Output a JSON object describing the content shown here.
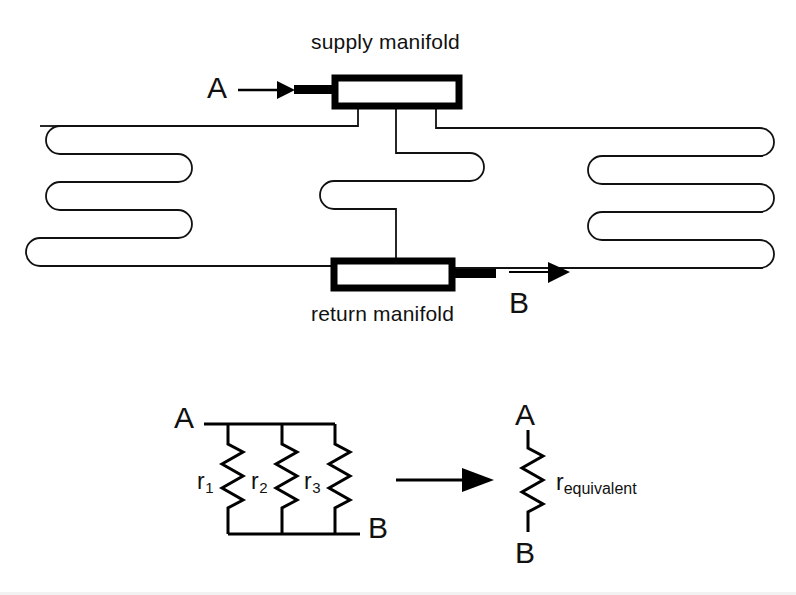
{
  "figure": {
    "title_top": "supply manifold",
    "title_bottom": "return manifold",
    "inlet_label": "A",
    "outlet_label": "B",
    "ink_color": "#000000",
    "background_color": "#ffffff"
  },
  "manifold_diagram": {
    "supply_manifold_label": "supply manifold",
    "return_manifold_label": "return manifold",
    "inlet_node": "A",
    "outlet_node": "B",
    "circuit_count": 3,
    "circuits": [
      {
        "name": "left-circuit",
        "passes": 3
      },
      {
        "name": "middle-circuit",
        "passes": 2
      },
      {
        "name": "right-circuit",
        "passes": 4
      }
    ]
  },
  "circuit_diagram": {
    "parallel": {
      "top_node": "A",
      "bottom_node": "B",
      "resistors": [
        {
          "base": "r",
          "sub": "1"
        },
        {
          "base": "r",
          "sub": "2"
        },
        {
          "base": "r",
          "sub": "3"
        }
      ]
    },
    "transform_arrow": "arrow-right",
    "equivalent": {
      "top_node": "A",
      "bottom_node": "B",
      "resistor": {
        "base": "r",
        "sub": "equivalent"
      }
    }
  }
}
